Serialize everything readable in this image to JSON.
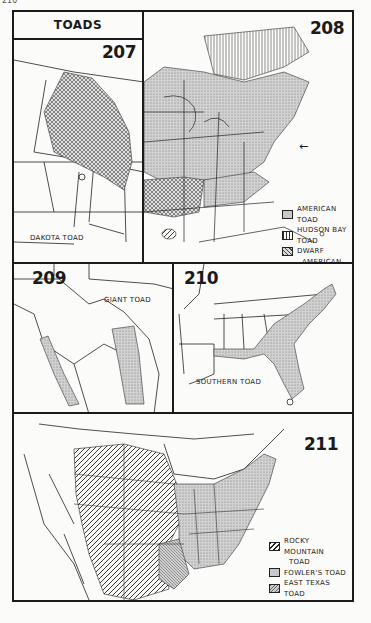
{
  "page_number": "210",
  "header": {
    "title": "TOADS"
  },
  "panels": [
    {
      "id": "207",
      "number": "207",
      "label": "DAKOTA TOAD"
    },
    {
      "id": "208",
      "number": "208",
      "legend": [
        {
          "pattern": "fine-stipple",
          "label": "AMERICAN TOAD"
        },
        {
          "pattern": "vertical-lines",
          "label": "HUDSON BAY TOAD"
        },
        {
          "pattern": "crosshatch",
          "label": "DWARF",
          "label_cont": "AMERICAN TOAD"
        },
        {
          "pattern": "diagonal-lines",
          "label": "HOUSTON TOAD"
        }
      ],
      "arrow": "←"
    },
    {
      "id": "209",
      "number": "209",
      "label": "GIANT TOAD"
    },
    {
      "id": "210",
      "number": "210",
      "label": "SOUTHERN TOAD"
    },
    {
      "id": "211",
      "number": "211",
      "legend": [
        {
          "pattern": "wide-diagonal",
          "label": "ROCKY MOUNTAIN",
          "label_cont": "TOAD"
        },
        {
          "pattern": "fine-stipple",
          "label": "FOWLER'S TOAD"
        },
        {
          "pattern": "fine-diagonal",
          "label": "EAST TEXAS TOAD"
        }
      ]
    }
  ],
  "colors": {
    "ink": "#1a1a1a",
    "paper": "#fbfbfa",
    "stipple": "#bdbdbd"
  }
}
